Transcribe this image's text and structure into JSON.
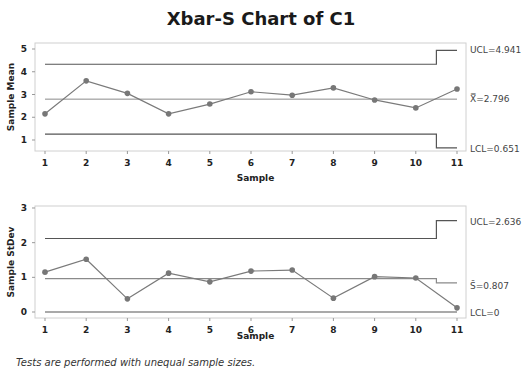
{
  "chart_data": [
    {
      "type": "line",
      "title": "Xbar-S Chart of C1",
      "subplot": "Xbar",
      "xlabel": "Sample",
      "ylabel": "Sample Mean",
      "x": [
        1,
        2,
        3,
        4,
        5,
        6,
        7,
        8,
        9,
        10,
        11
      ],
      "series": [
        {
          "name": "Sample Mean",
          "values": [
            2.15,
            3.6,
            3.05,
            2.15,
            2.58,
            3.12,
            2.97,
            3.29,
            2.76,
            2.41,
            3.24
          ]
        }
      ],
      "center_line": {
        "label": "X̿=2.796",
        "value": 2.796
      },
      "ucl": {
        "label": "UCL=4.941",
        "value": 4.941,
        "steps": [
          4.33,
          4.33,
          4.33,
          4.33,
          4.33,
          4.33,
          4.33,
          4.33,
          4.33,
          4.33,
          4.941
        ]
      },
      "lcl": {
        "label": "LCL=0.651",
        "value": 0.651,
        "steps": [
          1.26,
          1.26,
          1.26,
          1.26,
          1.26,
          1.26,
          1.26,
          1.26,
          1.26,
          1.26,
          0.651
        ]
      },
      "yticks": [
        1,
        2,
        3,
        4,
        5
      ],
      "ylim": [
        0.5,
        5.3
      ],
      "xlim": [
        0.75,
        11.25
      ],
      "grid": false
    },
    {
      "type": "line",
      "subplot": "S",
      "xlabel": "Sample",
      "ylabel": "Sample StDev",
      "x": [
        1,
        2,
        3,
        4,
        5,
        6,
        7,
        8,
        9,
        10,
        11
      ],
      "series": [
        {
          "name": "Sample StDev",
          "values": [
            1.15,
            1.52,
            0.38,
            1.12,
            0.87,
            1.18,
            1.21,
            0.4,
            1.02,
            0.98,
            0.12
          ]
        }
      ],
      "center_line": {
        "label": "S̄=0.807",
        "value": 0.807,
        "steps": [
          0.96,
          0.96,
          0.96,
          0.96,
          0.96,
          0.96,
          0.96,
          0.96,
          0.96,
          0.96,
          0.84
        ]
      },
      "ucl": {
        "label": "UCL=2.636",
        "value": 2.636,
        "steps": [
          2.12,
          2.12,
          2.12,
          2.12,
          2.12,
          2.12,
          2.12,
          2.12,
          2.12,
          2.12,
          2.636
        ]
      },
      "lcl": {
        "label": "LCL=0",
        "value": 0
      },
      "yticks": [
        0,
        1,
        2,
        3
      ],
      "ylim": [
        -0.15,
        3.05
      ],
      "xlim": [
        0.75,
        11.25
      ],
      "grid": false
    }
  ],
  "title": "Xbar-S Chart of C1",
  "footnote": "Tests are performed with unequal sample sizes.",
  "colors": {
    "line": "#7a7a7a",
    "limits": "#555555",
    "center": "#8a8a8a",
    "frame": "#d0d0d0"
  }
}
